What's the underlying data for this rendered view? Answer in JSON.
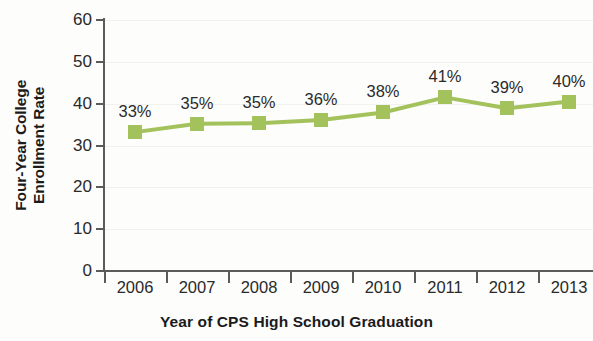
{
  "chart_data": {
    "type": "line",
    "title": "",
    "xlabel": "Year of CPS High School Graduation",
    "ylabel_line1": "Four-Year College",
    "ylabel_line2": "Enrollment Rate",
    "ylabel": "Four-Year College Enrollment Rate",
    "categories": [
      "2006",
      "2007",
      "2008",
      "2009",
      "2010",
      "2011",
      "2012",
      "2013"
    ],
    "values": [
      33,
      35,
      35,
      36,
      38,
      41,
      39,
      40
    ],
    "plotted_values": [
      33.2,
      35.2,
      35.3,
      36.1,
      37.9,
      41.5,
      38.9,
      40.5
    ],
    "data_labels": [
      "33%",
      "35%",
      "35%",
      "36%",
      "38%",
      "41%",
      "39%",
      "40%"
    ],
    "ylim": [
      0,
      60
    ],
    "y_ticks": [
      0,
      10,
      20,
      30,
      40,
      50,
      60
    ],
    "y_tick_labels": [
      "0",
      "10",
      "20",
      "30",
      "40",
      "50",
      "60"
    ],
    "grid": true,
    "legend": "none",
    "series_color": "#a3c25c",
    "marker": "square",
    "axis_color": "#5b5b5b",
    "background_color": "#fdfdfc"
  }
}
